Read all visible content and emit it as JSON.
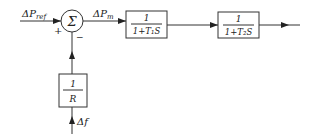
{
  "diagram": {
    "type": "control-block-diagram",
    "colors": {
      "stroke": "#333333",
      "text": "#222222",
      "background": "#ffffff"
    },
    "inputs": {
      "reference": {
        "symbol": "ΔP",
        "subscript": "ref"
      },
      "feedback": {
        "symbol": "Δf"
      }
    },
    "summing_junction": {
      "symbol": "Σ",
      "plus_sign": "+",
      "minus_sign": "−"
    },
    "signals": {
      "mechanical_power": {
        "symbol": "ΔP",
        "subscript": "m"
      }
    },
    "blocks": [
      {
        "id": "block1",
        "numerator": "1",
        "denominator": "1+T₁S"
      },
      {
        "id": "block2",
        "numerator": "1",
        "denominator": "1+T₂S"
      },
      {
        "id": "droop",
        "numerator": "1",
        "denominator": "R"
      }
    ]
  }
}
